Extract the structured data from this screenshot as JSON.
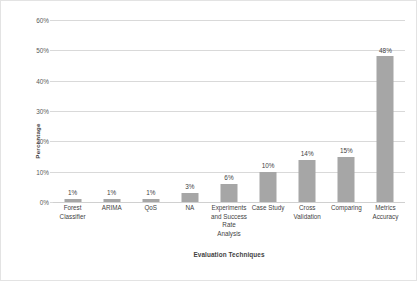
{
  "chart_data": {
    "type": "bar",
    "title": "",
    "xlabel": "Evaluation Techniques",
    "ylabel": "Percentage",
    "categories": [
      "Forest Classifier",
      "ARIMA",
      "QoS",
      "NA",
      "Experiments and Success Rate Analysis",
      "Case Study",
      "Cross Validation",
      "Comparing",
      "Metrics Accuracy"
    ],
    "category_lines": [
      [
        "Forest",
        "Classifier"
      ],
      [
        "ARIMA"
      ],
      [
        "QoS"
      ],
      [
        "NA"
      ],
      [
        "Experiments",
        "and Success",
        "Rate",
        "Analysis"
      ],
      [
        "Case Study"
      ],
      [
        "Cross",
        "Validation"
      ],
      [
        "Comparing"
      ],
      [
        "Metrics",
        "Accuracy"
      ]
    ],
    "values": [
      1,
      1,
      1,
      3,
      6,
      10,
      14,
      15,
      48
    ],
    "value_labels": [
      "1%",
      "1%",
      "1%",
      "3%",
      "6%",
      "10%",
      "14%",
      "15%",
      "48%"
    ],
    "ylim": [
      0,
      60
    ],
    "ytick_values": [
      0,
      10,
      20,
      30,
      40,
      50,
      60
    ],
    "ytick_labels": [
      "0%",
      "10%",
      "20%",
      "30%",
      "40%",
      "50%",
      "60%"
    ],
    "grid": true,
    "grid_axis": "y",
    "legend": false,
    "legend_position": "none",
    "bar_color": "#a6a6a6",
    "gridline_color": "#d9d9d9",
    "text_color": "#3f3f3f",
    "background_color": "#ffffff",
    "border_color": "#e3e3e3"
  }
}
